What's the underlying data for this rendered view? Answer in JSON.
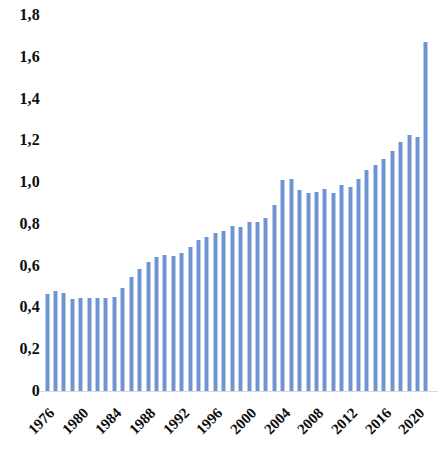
{
  "chart_data": {
    "type": "bar",
    "title": "",
    "subtitle": "",
    "xlabel": "",
    "ylabel": "",
    "ylim": [
      0,
      1.8
    ],
    "ytick_labels": [
      "1,8",
      "1,6",
      "1,4",
      "1,2",
      "1,0",
      "0,8",
      "0,6",
      "0,4",
      "0,2",
      "0"
    ],
    "ytick_values": [
      1.8,
      1.6,
      1.4,
      1.2,
      1.0,
      0.8,
      0.6,
      0.4,
      0.2,
      0
    ],
    "decimal_separator": ",",
    "grid": false,
    "legend": "none",
    "bar_color": "#6f94d2",
    "xtick_labels": [
      "1976",
      "1980",
      "1984",
      "1988",
      "1992",
      "1996",
      "2000",
      "2004",
      "2008",
      "2012",
      "2016",
      "2020"
    ],
    "xtick_rotation": -45,
    "categories": [
      "1976",
      "1977",
      "1978",
      "1979",
      "1980",
      "1981",
      "1982",
      "1983",
      "1984",
      "1985",
      "1986",
      "1987",
      "1988",
      "1989",
      "1990",
      "1991",
      "1992",
      "1993",
      "1994",
      "1995",
      "1996",
      "1997",
      "1998",
      "1999",
      "2000",
      "2001",
      "2002",
      "2003",
      "2004",
      "2005",
      "2006",
      "2007",
      "2008",
      "2009",
      "2010",
      "2011",
      "2012",
      "2013",
      "2014",
      "2015",
      "2016",
      "2017",
      "2018",
      "2019",
      "2020",
      "2021"
    ],
    "values": [
      0.465,
      0.478,
      0.47,
      0.44,
      0.447,
      0.445,
      0.443,
      0.447,
      0.45,
      0.492,
      0.545,
      0.585,
      0.62,
      0.64,
      0.65,
      0.648,
      0.66,
      0.69,
      0.725,
      0.735,
      0.755,
      0.765,
      0.79,
      0.785,
      0.81,
      0.81,
      0.83,
      0.89,
      1.01,
      1.015,
      0.96,
      0.95,
      0.955,
      0.965,
      0.95,
      0.985,
      0.975,
      1.015,
      1.06,
      1.08,
      1.11,
      1.15,
      1.19,
      1.225,
      1.215,
      1.67
    ]
  }
}
